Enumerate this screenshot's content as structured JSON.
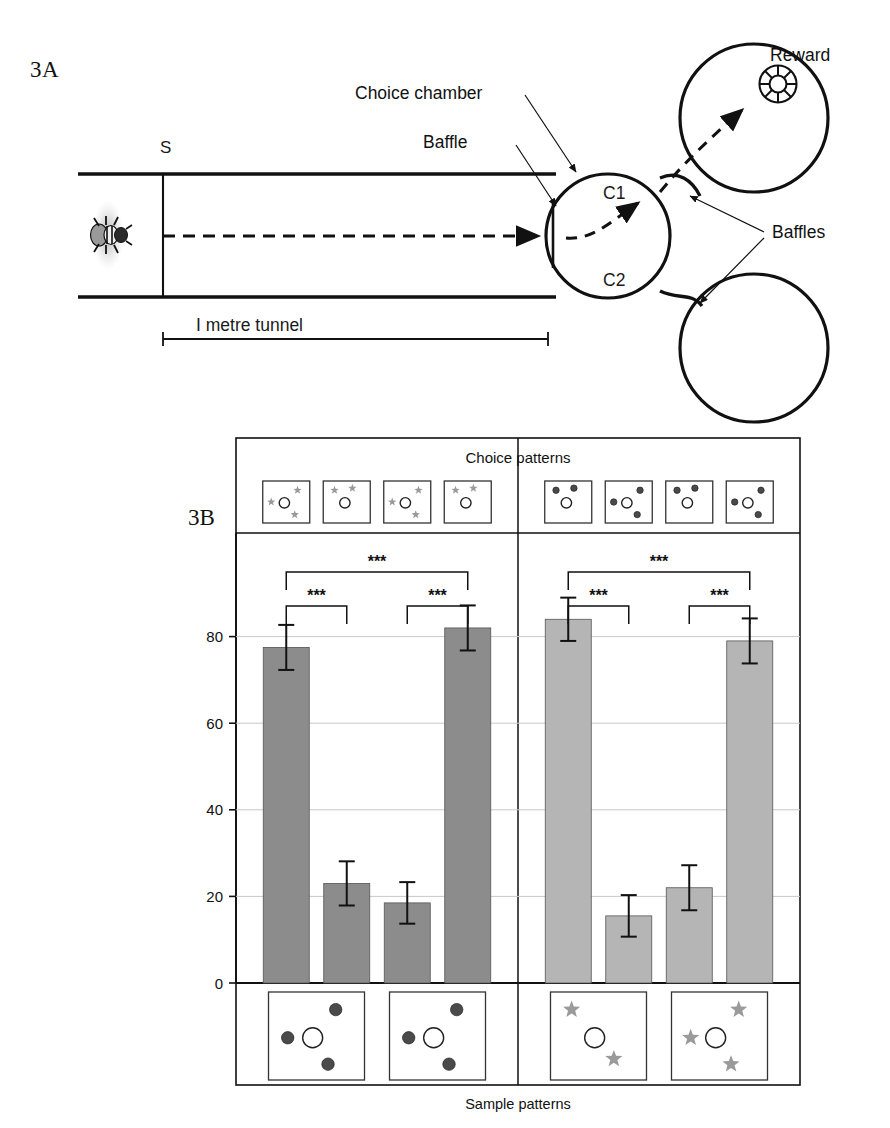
{
  "figure": {
    "panel_a_label": "3A",
    "panel_b_label": "3B"
  },
  "panel_a": {
    "annotations": {
      "choice_chamber": "Choice chamber",
      "baffle": "Baffle",
      "baffles": "Baffles",
      "reward": "Reward"
    },
    "labels": {
      "start": "S",
      "c1": "C1",
      "c2": "C2",
      "tunnel": "I metre tunnel"
    },
    "icons": {
      "bee": "bee-icon",
      "reward": "reward-feeder-icon",
      "flight_path": "dashed-flight-path"
    }
  },
  "chart_data": {
    "type": "bar",
    "title": "",
    "xlabel": "Sample patterns",
    "ylabel": "Choice p[ercentages",
    "top_label": "Choice patterns",
    "ylim": [
      0,
      100
    ],
    "yticks": [
      0,
      20,
      40,
      60,
      80
    ],
    "grid": true,
    "legend": "none",
    "categories": [
      "C1",
      "C2",
      "C3",
      "C4",
      "C5",
      "C6",
      "C7",
      "C8"
    ],
    "values": [
      77.5,
      23,
      18.5,
      82,
      84,
      15.5,
      22,
      79
    ],
    "errors": [
      5.2,
      5.1,
      4.8,
      5.2,
      5.0,
      4.8,
      5.2,
      5.2
    ],
    "bar_colors": [
      "#8c8c8c",
      "#8c8c8c",
      "#8c8c8c",
      "#8c8c8c",
      "#b5b5b5",
      "#b5b5b5",
      "#b5b5b5",
      "#b5b5b5"
    ],
    "groups": [
      {
        "name": "star-trained",
        "bars": [
          0,
          1,
          2,
          3
        ],
        "fill": "#8c8c8c"
      },
      {
        "name": "dot-trained",
        "bars": [
          4,
          5,
          6,
          7
        ],
        "fill": "#b5b5b5"
      }
    ],
    "significance": [
      {
        "from": 0,
        "to": 3,
        "label": "***",
        "level": "outer"
      },
      {
        "from": 0,
        "to": 1,
        "label": "***",
        "level": "inner"
      },
      {
        "from": 2,
        "to": 3,
        "label": "***",
        "level": "inner"
      },
      {
        "from": 4,
        "to": 7,
        "label": "***",
        "level": "outer"
      },
      {
        "from": 4,
        "to": 5,
        "label": "***",
        "level": "inner"
      },
      {
        "from": 6,
        "to": 7,
        "label": "***",
        "level": "inner"
      }
    ],
    "choice_patterns": [
      {
        "index": 0,
        "element": "star",
        "count": 3,
        "color": "#9a9a9a"
      },
      {
        "index": 1,
        "element": "star",
        "count": 2,
        "color": "#9a9a9a"
      },
      {
        "index": 2,
        "element": "star",
        "count": 3,
        "color": "#9a9a9a"
      },
      {
        "index": 3,
        "element": "star",
        "count": 2,
        "color": "#9a9a9a"
      },
      {
        "index": 4,
        "element": "dot",
        "count": 2,
        "color": "#4a4a4a"
      },
      {
        "index": 5,
        "element": "dot",
        "count": 3,
        "color": "#4a4a4a"
      },
      {
        "index": 6,
        "element": "dot",
        "count": 2,
        "color": "#4a4a4a"
      },
      {
        "index": 7,
        "element": "dot",
        "count": 3,
        "color": "#4a4a4a"
      }
    ],
    "sample_patterns": [
      {
        "index": 0,
        "element": "dot",
        "count": 3,
        "color": "#4a4a4a"
      },
      {
        "index": 1,
        "element": "dot",
        "count": 3,
        "color": "#4a4a4a"
      },
      {
        "index": 2,
        "element": "star",
        "count": 2,
        "color": "#9a9a9a"
      },
      {
        "index": 3,
        "element": "star",
        "count": 3,
        "color": "#9a9a9a"
      }
    ]
  }
}
